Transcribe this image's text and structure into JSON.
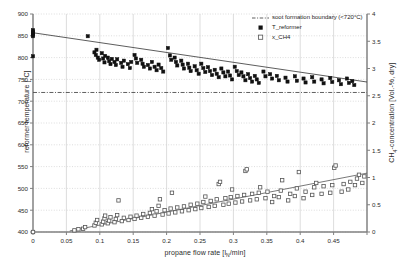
{
  "chart_data": {
    "type": "scatter",
    "title": "",
    "xlabel": "propane flow rate [lN/min]",
    "xlabel_main": "propane flow rate [l",
    "xlabel_sub": "N",
    "xlabel_tail": "/min]",
    "ylabel_left": "reformer temperature [°C]",
    "ylabel_right": "CH4-concentration [Vol.-%, dry]",
    "ylabel_right_main": "CH",
    "ylabel_right_sub": "4",
    "ylabel_right_tail": "-concentration [Vol.-%, dry]",
    "xlim": [
      0,
      0.5
    ],
    "ylim_left": [
      400,
      900
    ],
    "ylim_right": [
      0,
      4
    ],
    "xticks": [
      0,
      0.05,
      0.1,
      0.15,
      0.2,
      0.25,
      0.3,
      0.35,
      0.4,
      0.45,
      0.5
    ],
    "xticklabels": [
      "0",
      "0.05",
      "0.1",
      "0.15",
      "0.2",
      "0.25",
      "0.3",
      "0.35",
      "0.4",
      "0.45",
      ""
    ],
    "yticks_left": [
      400,
      450,
      500,
      550,
      600,
      650,
      700,
      750,
      800,
      850,
      900
    ],
    "yticklabels_left": [
      "400",
      "450",
      "500",
      "550",
      "600",
      "650",
      "700",
      "750",
      "800",
      "850",
      "900"
    ],
    "yticks_right": [
      0,
      0.5,
      1,
      1.5,
      2,
      2.5,
      3,
      3.5,
      4
    ],
    "yticklabels_right": [
      "0",
      "0.5",
      "1",
      "1.5",
      "2",
      "2.5",
      "3",
      "3.5",
      "4"
    ],
    "grid": true,
    "grid_color": "#cfcfcf",
    "frame_color": "#808080",
    "legend_position": "top-right",
    "legend": [
      {
        "label": "soot formation boundary (<720°C)",
        "marker": "dashdot-line",
        "color": "#4d4d4d"
      },
      {
        "label": "T_reformer",
        "marker": "filled-square",
        "color": "#111111"
      },
      {
        "label": "x_CH4",
        "marker": "open-square",
        "color": "#555555"
      }
    ],
    "soot_boundary": {
      "value": 720,
      "axis": "left",
      "style": "dash-dot",
      "label": "soot formation boundary (<720°C)"
    },
    "series": [
      {
        "name": "T_reformer",
        "axis": "left",
        "marker": "filled-square",
        "color": "#111111",
        "trendline": {
          "type": "linear-fit",
          "x": [
            0,
            0.5
          ],
          "y": [
            857,
            744
          ],
          "color": "#333333"
        },
        "points": [
          [
            0.0,
            857
          ],
          [
            0.0,
            855
          ],
          [
            0.0,
            860
          ],
          [
            0.0,
            852
          ],
          [
            0.0,
            849
          ],
          [
            0.0,
            863
          ],
          [
            0.0,
            803
          ],
          [
            0.082,
            849
          ],
          [
            0.092,
            812
          ],
          [
            0.094,
            806
          ],
          [
            0.095,
            818
          ],
          [
            0.097,
            800
          ],
          [
            0.099,
            795
          ],
          [
            0.103,
            810
          ],
          [
            0.105,
            798
          ],
          [
            0.107,
            789
          ],
          [
            0.108,
            804
          ],
          [
            0.112,
            800
          ],
          [
            0.114,
            792
          ],
          [
            0.116,
            785
          ],
          [
            0.118,
            797
          ],
          [
            0.122,
            790
          ],
          [
            0.124,
            783
          ],
          [
            0.126,
            796
          ],
          [
            0.132,
            788
          ],
          [
            0.134,
            779
          ],
          [
            0.136,
            793
          ],
          [
            0.142,
            785
          ],
          [
            0.145,
            776
          ],
          [
            0.147,
            790
          ],
          [
            0.152,
            806
          ],
          [
            0.154,
            798
          ],
          [
            0.156,
            788
          ],
          [
            0.162,
            795
          ],
          [
            0.164,
            786
          ],
          [
            0.166,
            779
          ],
          [
            0.172,
            783
          ],
          [
            0.175,
            775
          ],
          [
            0.178,
            790
          ],
          [
            0.182,
            779
          ],
          [
            0.185,
            771
          ],
          [
            0.188,
            784
          ],
          [
            0.192,
            776
          ],
          [
            0.195,
            768
          ],
          [
            0.202,
            822
          ],
          [
            0.205,
            805
          ],
          [
            0.207,
            795
          ],
          [
            0.212,
            800
          ],
          [
            0.214,
            790
          ],
          [
            0.216,
            782
          ],
          [
            0.222,
            793
          ],
          [
            0.224,
            784
          ],
          [
            0.226,
            775
          ],
          [
            0.232,
            786
          ],
          [
            0.234,
            777
          ],
          [
            0.236,
            769
          ],
          [
            0.242,
            780
          ],
          [
            0.245,
            771
          ],
          [
            0.248,
            763
          ],
          [
            0.252,
            786
          ],
          [
            0.255,
            776
          ],
          [
            0.258,
            767
          ],
          [
            0.262,
            778
          ],
          [
            0.265,
            769
          ],
          [
            0.268,
            760
          ],
          [
            0.272,
            772
          ],
          [
            0.275,
            763
          ],
          [
            0.278,
            755
          ],
          [
            0.282,
            775
          ],
          [
            0.285,
            766
          ],
          [
            0.288,
            757
          ],
          [
            0.292,
            768
          ],
          [
            0.295,
            759
          ],
          [
            0.298,
            750
          ],
          [
            0.302,
            779
          ],
          [
            0.305,
            769
          ],
          [
            0.308,
            760
          ],
          [
            0.312,
            766
          ],
          [
            0.315,
            757
          ],
          [
            0.318,
            748
          ],
          [
            0.322,
            762
          ],
          [
            0.325,
            753
          ],
          [
            0.328,
            745
          ],
          [
            0.332,
            758
          ],
          [
            0.335,
            750
          ],
          [
            0.338,
            742
          ],
          [
            0.345,
            768
          ],
          [
            0.348,
            757
          ],
          [
            0.355,
            762
          ],
          [
            0.358,
            752
          ],
          [
            0.365,
            758
          ],
          [
            0.368,
            748
          ],
          [
            0.378,
            754
          ],
          [
            0.381,
            745
          ],
          [
            0.392,
            757
          ],
          [
            0.395,
            747
          ],
          [
            0.405,
            752
          ],
          [
            0.408,
            743
          ],
          [
            0.418,
            755
          ],
          [
            0.421,
            745
          ],
          [
            0.432,
            750
          ],
          [
            0.435,
            741
          ],
          [
            0.445,
            753
          ],
          [
            0.448,
            744
          ],
          [
            0.458,
            748
          ],
          [
            0.461,
            739
          ],
          [
            0.47,
            752
          ],
          [
            0.473,
            742
          ],
          [
            0.478,
            746
          ],
          [
            0.481,
            737
          ]
        ]
      },
      {
        "name": "x_CH4",
        "axis": "right",
        "marker": "open-square",
        "color": "#555555",
        "trendline": {
          "type": "linear-fit",
          "x": [
            0.055,
            0.5
          ],
          "y": [
            0.02,
            1.08
          ],
          "color": "#555555"
        },
        "points": [
          [
            0.0,
            0.0
          ],
          [
            0.062,
            0.03
          ],
          [
            0.068,
            0.05
          ],
          [
            0.075,
            0.06
          ],
          [
            0.078,
            0.09
          ],
          [
            0.092,
            0.12
          ],
          [
            0.094,
            0.17
          ],
          [
            0.096,
            0.22
          ],
          [
            0.103,
            0.14
          ],
          [
            0.105,
            0.19
          ],
          [
            0.107,
            0.25
          ],
          [
            0.108,
            0.3
          ],
          [
            0.112,
            0.16
          ],
          [
            0.114,
            0.21
          ],
          [
            0.116,
            0.27
          ],
          [
            0.122,
            0.18
          ],
          [
            0.124,
            0.24
          ],
          [
            0.126,
            0.31
          ],
          [
            0.128,
            0.58
          ],
          [
            0.133,
            0.2
          ],
          [
            0.136,
            0.26
          ],
          [
            0.143,
            0.22
          ],
          [
            0.146,
            0.28
          ],
          [
            0.152,
            0.24
          ],
          [
            0.155,
            0.3
          ],
          [
            0.162,
            0.26
          ],
          [
            0.165,
            0.33
          ],
          [
            0.172,
            0.28
          ],
          [
            0.175,
            0.35
          ],
          [
            0.178,
            0.42
          ],
          [
            0.182,
            0.3
          ],
          [
            0.185,
            0.38
          ],
          [
            0.188,
            0.48
          ],
          [
            0.19,
            0.6
          ],
          [
            0.194,
            0.32
          ],
          [
            0.197,
            0.4
          ],
          [
            0.203,
            0.34
          ],
          [
            0.206,
            0.43
          ],
          [
            0.208,
            0.72
          ],
          [
            0.213,
            0.36
          ],
          [
            0.216,
            0.45
          ],
          [
            0.223,
            0.38
          ],
          [
            0.226,
            0.47
          ],
          [
            0.233,
            0.4
          ],
          [
            0.236,
            0.5
          ],
          [
            0.243,
            0.42
          ],
          [
            0.246,
            0.52
          ],
          [
            0.252,
            0.44
          ],
          [
            0.255,
            0.55
          ],
          [
            0.258,
            0.65
          ],
          [
            0.263,
            0.46
          ],
          [
            0.266,
            0.57
          ],
          [
            0.272,
            0.48
          ],
          [
            0.275,
            0.6
          ],
          [
            0.278,
            0.88
          ],
          [
            0.28,
            0.92
          ],
          [
            0.285,
            0.5
          ],
          [
            0.288,
            0.62
          ],
          [
            0.293,
            0.52
          ],
          [
            0.296,
            0.64
          ],
          [
            0.298,
            0.78
          ],
          [
            0.303,
            0.54
          ],
          [
            0.306,
            0.66
          ],
          [
            0.313,
            0.56
          ],
          [
            0.316,
            0.68
          ],
          [
            0.318,
            1.12
          ],
          [
            0.32,
            1.15
          ],
          [
            0.325,
            0.58
          ],
          [
            0.328,
            0.7
          ],
          [
            0.335,
            0.6
          ],
          [
            0.338,
            0.72
          ],
          [
            0.34,
            0.82
          ],
          [
            0.348,
            0.62
          ],
          [
            0.351,
            0.74
          ],
          [
            0.358,
            0.55
          ],
          [
            0.361,
            0.66
          ],
          [
            0.368,
            0.64
          ],
          [
            0.371,
            0.76
          ],
          [
            0.373,
            0.95
          ],
          [
            0.382,
            0.58
          ],
          [
            0.385,
            0.7
          ],
          [
            0.392,
            0.66
          ],
          [
            0.395,
            0.8
          ],
          [
            0.398,
            1.1
          ],
          [
            0.405,
            0.62
          ],
          [
            0.408,
            0.74
          ],
          [
            0.418,
            0.68
          ],
          [
            0.421,
            0.82
          ],
          [
            0.424,
            0.9
          ],
          [
            0.432,
            0.7
          ],
          [
            0.435,
            0.84
          ],
          [
            0.445,
            0.72
          ],
          [
            0.448,
            0.86
          ],
          [
            0.451,
            1.18
          ],
          [
            0.453,
            1.22
          ],
          [
            0.462,
            0.74
          ],
          [
            0.465,
            0.88
          ],
          [
            0.472,
            0.78
          ],
          [
            0.475,
            0.92
          ],
          [
            0.482,
            0.86
          ],
          [
            0.485,
            0.98
          ],
          [
            0.488,
            1.05
          ],
          [
            0.493,
            0.9
          ],
          [
            0.496,
            1.02
          ]
        ]
      }
    ]
  }
}
